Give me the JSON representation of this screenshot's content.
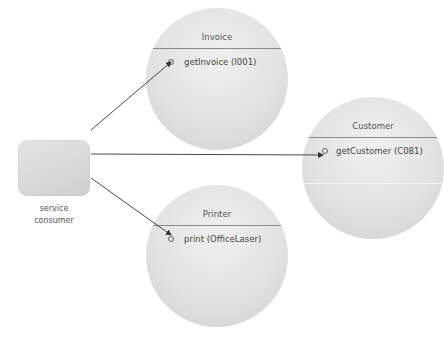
{
  "consumer": {
    "label_line1": "service",
    "label_line2": "consumer"
  },
  "components": [
    {
      "name": "Invoice",
      "operation": "getInvoice (I001)"
    },
    {
      "name": "Customer",
      "operation": "getCustomer (C081)"
    },
    {
      "name": "Printer",
      "operation": "print (OfficeLaser)"
    }
  ],
  "colors": {
    "link": "#333333",
    "divider": "#8a8a8a",
    "node_fill": "#e2e2e2"
  }
}
